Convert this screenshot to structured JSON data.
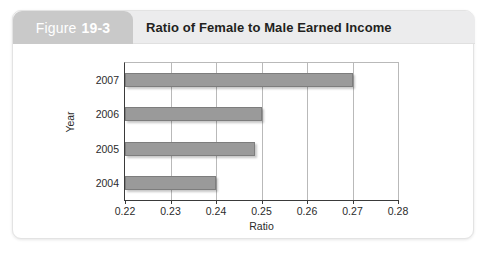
{
  "figure": {
    "tab_word": "Figure",
    "tab_number": "19-3",
    "title": "Ratio of Female to Male Earned Income"
  },
  "colors": {
    "tab_background": "#c9c9c9",
    "header_background": "#ececed",
    "bar_fill": "#9a9a9a",
    "bar_stroke": "#7d7d7d",
    "gridline": "#b9b9b9",
    "axis": "#3a3a3a"
  },
  "chart_data": {
    "type": "bar",
    "orientation": "horizontal",
    "title": "Ratio of Female to Male Earned Income",
    "categories": [
      "2007",
      "2006",
      "2005",
      "2004"
    ],
    "values": [
      0.27,
      0.25,
      0.2485,
      0.24
    ],
    "series": [
      {
        "name": "Ratio of Female to Male Earned Income",
        "values": [
          0.27,
          0.25,
          0.2485,
          0.24
        ]
      }
    ],
    "xlabel": "Ratio",
    "ylabel": "Year",
    "xlim": [
      0.22,
      0.28
    ],
    "xticks": [
      0.22,
      0.23,
      0.24,
      0.25,
      0.26,
      0.27,
      0.28
    ],
    "xticklabels": [
      "0.22",
      "0.23",
      "0.24",
      "0.25",
      "0.26",
      "0.27",
      "0.28"
    ],
    "grid": "vertical",
    "legend": "none"
  }
}
